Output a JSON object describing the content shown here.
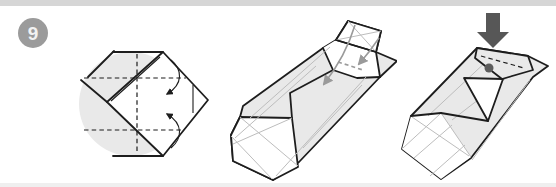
{
  "step": {
    "number": "9"
  },
  "colors": {
    "page_bg": "#ffffff",
    "divider_top": "#d6d6d6",
    "divider_bottom": "#efefef",
    "badge_bg": "#9b9b9b",
    "badge_text": "#f2f2f2",
    "paper_gray": "#e9e9e9",
    "paper_white": "#ffffff",
    "outline": "#1d1d1d",
    "crease": "#bdbdbd",
    "arrow_gray": "#9a9a9a",
    "push_arrow": "#575757",
    "dot_gray": "#5c5c5c"
  },
  "figures": {
    "fig1": {
      "label": "flat diamond with valley-fold creases and two curved fold arrows"
    },
    "fig2": {
      "label": "partially folded box with flaps and gray guide arrows"
    },
    "fig3": {
      "label": "folded box with push-down arrow and reference dot"
    }
  },
  "icons": {
    "fold_arrow": "curved-fold-arrow",
    "push_arrow": "push-down-block-arrow",
    "reference_dot": "reference-dot"
  }
}
